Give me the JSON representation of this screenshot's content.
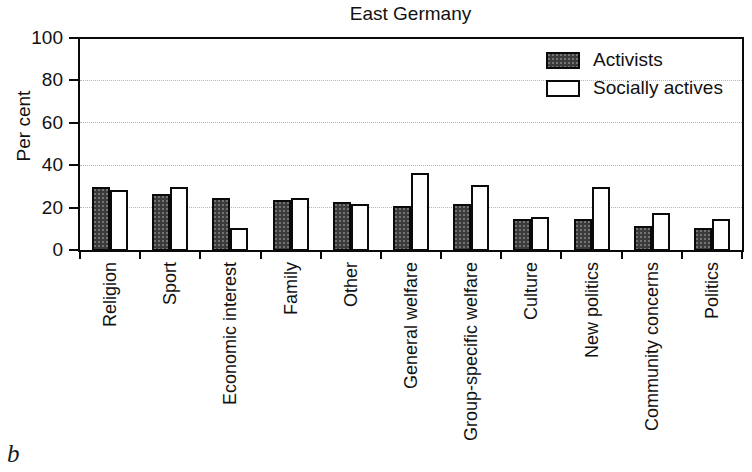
{
  "figure_label": "b",
  "chart_data": {
    "type": "bar",
    "title": "East Germany",
    "xlabel": "",
    "ylabel": "Per cent",
    "ylim": [
      0,
      100
    ],
    "yticks": [
      0,
      20,
      40,
      60,
      80,
      100
    ],
    "grid": "horizontal dotted gridlines at 20, 40, 60, 80",
    "legend_position": "top-right inside plot area",
    "categories": [
      "Religion",
      "Sport",
      "Economic interest",
      "Family",
      "Other",
      "General welfare",
      "Group-specific welfare",
      "Culture",
      "New politics",
      "Community concerns",
      "Politics"
    ],
    "series": [
      {
        "name": "Activists",
        "fill": "#3b3b3b",
        "values": [
          30,
          27,
          25,
          24,
          23,
          21,
          22,
          15,
          15,
          12,
          11
        ]
      },
      {
        "name": "Socially actives",
        "fill": "#ffffff",
        "values": [
          29,
          30,
          11,
          25,
          22,
          37,
          31,
          16,
          30,
          18,
          15
        ]
      }
    ],
    "colors": {
      "bar_border": "#0a0a0a",
      "axis": "#0a0a0a",
      "gridline": "#b5b5b5",
      "text": "#111111",
      "background": "#ffffff"
    }
  }
}
